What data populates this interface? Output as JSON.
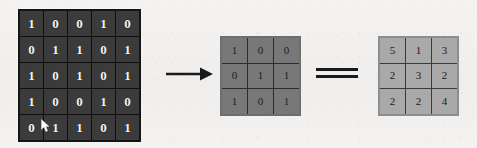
{
  "figure": {
    "type": "convolution-diagram",
    "background_color": "#f2f1ef"
  },
  "input_matrix": {
    "label": "input-feature-map",
    "rows": 5,
    "cols": 5,
    "cell_color": "#3b3b3b",
    "text_color": "#f4f4f4",
    "values": [
      [
        1,
        0,
        0,
        1,
        0
      ],
      [
        0,
        1,
        1,
        0,
        1
      ],
      [
        1,
        0,
        1,
        0,
        1
      ],
      [
        1,
        0,
        0,
        1,
        0
      ],
      [
        0,
        1,
        1,
        0,
        1
      ]
    ]
  },
  "kernel_matrix": {
    "label": "convolution-kernel",
    "rows": 3,
    "cols": 3,
    "cell_color": "#787878",
    "text_color": "#1b1b1b",
    "values": [
      [
        1,
        0,
        0
      ],
      [
        0,
        1,
        1
      ],
      [
        1,
        0,
        1
      ]
    ]
  },
  "result_matrix": {
    "label": "output-feature-map",
    "rows": 3,
    "cols": 3,
    "cell_color": "#a9a9a9",
    "text_color": "#1b1b1b",
    "values": [
      [
        5,
        1,
        3
      ],
      [
        2,
        3,
        2
      ],
      [
        2,
        2,
        4
      ]
    ]
  },
  "operators": {
    "arrow": {
      "icon": "right-arrow-icon",
      "glyph": "→",
      "color": "#1a1a1a"
    },
    "equals": {
      "icon": "equals-sign-icon",
      "glyph": "=",
      "color": "#1a1a1a"
    }
  },
  "cursor": {
    "icon": "mouse-pointer-icon",
    "color": "#ffffff"
  }
}
